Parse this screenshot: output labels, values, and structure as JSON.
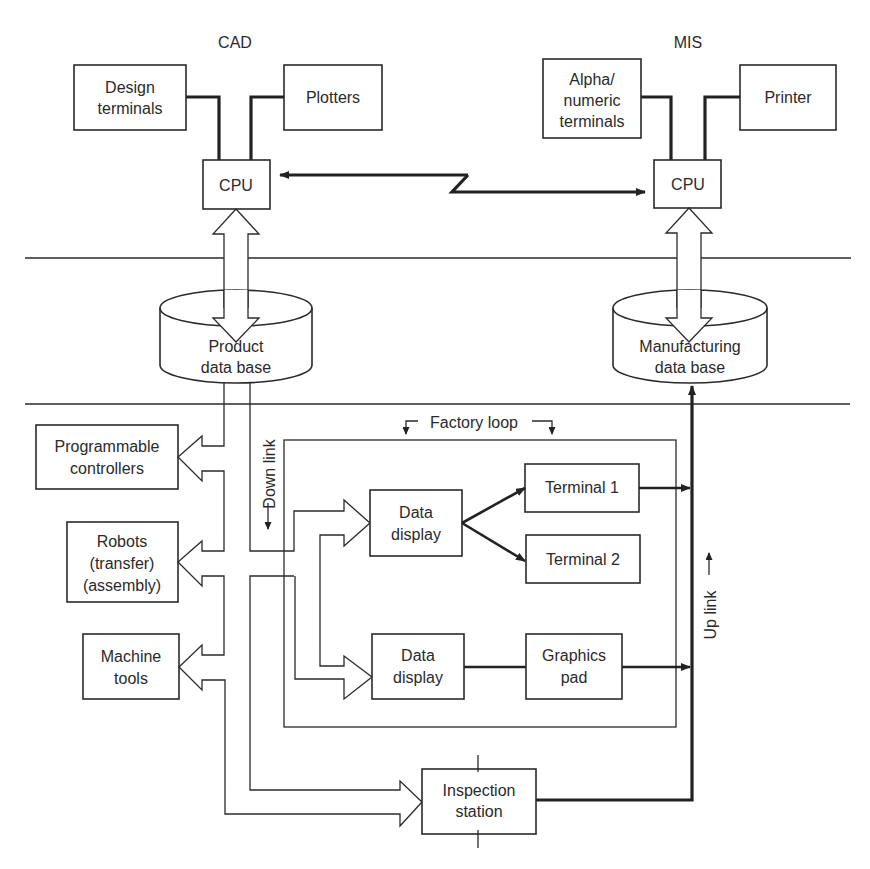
{
  "sections": {
    "cad": "CAD",
    "mis": "MIS"
  },
  "cad": {
    "design_terminals": [
      "Design",
      "terminals"
    ],
    "plotters": [
      "Plotters"
    ],
    "cpu": "CPU"
  },
  "mis": {
    "alpha_terminals": [
      "Alpha/",
      "numeric",
      "terminals"
    ],
    "printer": [
      "Printer"
    ],
    "cpu": "CPU"
  },
  "databases": {
    "product": [
      "Product",
      "data base"
    ],
    "manufacturing": [
      "Manufacturing",
      "data base"
    ]
  },
  "shop_floor": {
    "programmable_controllers": [
      "Programmable",
      "controllers"
    ],
    "robots": [
      "Robots",
      "(transfer)",
      "(assembly)"
    ],
    "machine_tools": [
      "Machine",
      "tools"
    ],
    "inspection_station": [
      "Inspection",
      "station"
    ]
  },
  "factory_loop": {
    "label": "Factory loop",
    "data_display_1": [
      "Data",
      "display"
    ],
    "data_display_2": [
      "Data",
      "display"
    ],
    "terminal_1": "Terminal 1",
    "terminal_2": "Terminal 2",
    "graphics_pad": [
      "Graphics",
      "pad"
    ]
  },
  "links": {
    "down_link": "Down link",
    "up_link": "Up link"
  }
}
